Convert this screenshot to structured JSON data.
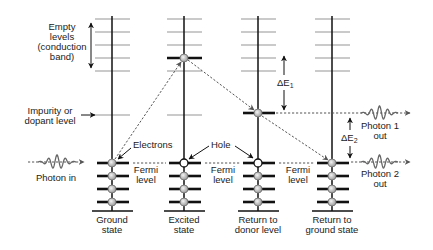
{
  "diagram": {
    "type": "energy-level diagram",
    "left_labels": {
      "conduction_band": [
        "Empty",
        "levels",
        "(conduction",
        "band)"
      ],
      "impurity": [
        "Impurity or",
        "dopant level"
      ],
      "photon_in": "Photon in"
    },
    "annotations": {
      "electrons": "Electrons",
      "hole": "Hole",
      "fermi": [
        "Fermi",
        "level"
      ],
      "delta_e1": {
        "symbol": "ΔE",
        "subscript": "1"
      },
      "delta_e2": {
        "symbol": "ΔE",
        "subscript": "2"
      },
      "photon1_out": [
        "Photon 1",
        "out"
      ],
      "photon2_out": [
        "Photon 2",
        "out"
      ]
    },
    "columns": [
      {
        "id": "ground",
        "label": [
          "Ground",
          "state"
        ],
        "excited_electron": false,
        "donor_electron": false,
        "hole": false
      },
      {
        "id": "excited",
        "label": [
          "Excited",
          "state"
        ],
        "excited_electron": true,
        "donor_electron": false,
        "hole": true
      },
      {
        "id": "donor",
        "label": [
          "Return to",
          "donor level"
        ],
        "excited_electron": false,
        "donor_electron": true,
        "hole": true
      },
      {
        "id": "return-ground",
        "label": [
          "Return to",
          "ground state"
        ],
        "excited_electron": false,
        "donor_electron": false,
        "hole": false
      }
    ],
    "colors": {
      "empty_level": "#b8b8b8",
      "filled_level": "#111111",
      "electron_fill": "#c8c8c8",
      "dashed_path": "#555555",
      "photon_wave": "#666666"
    }
  }
}
